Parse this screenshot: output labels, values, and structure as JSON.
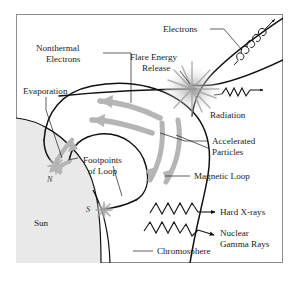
{
  "figure": {
    "background_color": "#ffffff",
    "frame_color": "#8c8c8c",
    "sun_fill_color": "#e9e9e9",
    "field_line_color": "#111111",
    "gray_arrow_color": "#b5b5b5",
    "flare_glow_color": "#bdbdbd"
  },
  "labels": {
    "electrons": "Electrons",
    "nonthermal_electrons_line1": "Nonthermal",
    "nonthermal_electrons_line2": "Electrons",
    "flare_energy_line1": "Flare Energy",
    "flare_energy_line2": "Release",
    "evaporation": "Evaporation",
    "radiation": "Radiation",
    "accelerated_line1": "Accelerated",
    "accelerated_line2": "Particles",
    "footpoints_line1": "Footpoints",
    "footpoints_line2": "of Loop",
    "magnetic_loop": "Magnetic Loop",
    "hard_xrays": "Hard X-rays",
    "nuclear_line1": "Nuclear",
    "nuclear_line2": "Gamma Rays",
    "chromosphere": "Chromosphere",
    "sun": "Sun",
    "polarity_north": "N",
    "polarity_south": "S"
  },
  "icons": {
    "helix": "electron-helix-icon",
    "zigzag_radiation": "radiation-zigzag-icon",
    "zigzag_hard_xray": "hard-xray-zigzag-icon",
    "zigzag_gamma": "gamma-ray-zigzag-icon",
    "starburst": "flare-starburst-icon",
    "footpoint_spark": "footpoint-spark-icon",
    "gray_flow_arrow": "plasma-flow-arrow-icon"
  }
}
